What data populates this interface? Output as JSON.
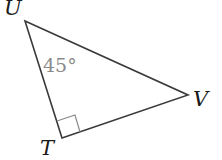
{
  "diagram": {
    "type": "right-triangle",
    "vertices": {
      "U": {
        "label": "U",
        "x": 25,
        "y": 21
      },
      "V": {
        "label": "V",
        "x": 188,
        "y": 95
      },
      "T": {
        "label": "T",
        "x": 62,
        "y": 138
      }
    },
    "angles": {
      "U": {
        "label": "45°"
      },
      "T": {
        "right_angle": true
      }
    },
    "colors": {
      "line": "#3a3a3a",
      "angle_text": "#8a8a8a",
      "right_angle_marker": "#8a8a8a",
      "label": "#1a1a1a"
    }
  }
}
